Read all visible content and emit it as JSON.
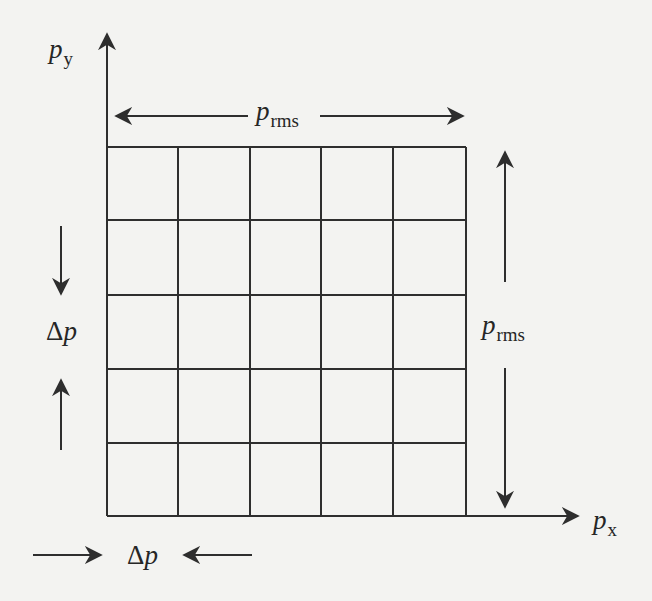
{
  "diagram": {
    "colors": {
      "background": "#f3f3f1",
      "line": "#2e2e2e",
      "text": "#262626"
    },
    "axes": {
      "x": {
        "symbol": "p",
        "subscript": "x"
      },
      "y": {
        "symbol": "p",
        "subscript": "y"
      }
    },
    "grid": {
      "rows": 5,
      "columns": 5,
      "cell_label": "Δp"
    },
    "annotations": {
      "top_span": {
        "symbol": "p",
        "subscript": "rms",
        "direction": "horizontal"
      },
      "right_span": {
        "symbol": "p",
        "subscript": "rms",
        "direction": "vertical"
      },
      "left_cell": {
        "delta": "Δ",
        "symbol": "p",
        "direction": "vertical"
      },
      "bottom_cell": {
        "delta": "Δ",
        "symbol": "p",
        "direction": "horizontal"
      }
    }
  }
}
